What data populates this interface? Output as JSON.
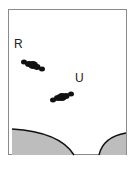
{
  "diagram": {
    "labels": {
      "r": "R",
      "u": "U"
    },
    "colors": {
      "frame": "#8a8a8a",
      "cell": "#111111",
      "tissue_fill": "#bdbdbd",
      "tissue_edge": "#111111"
    }
  }
}
